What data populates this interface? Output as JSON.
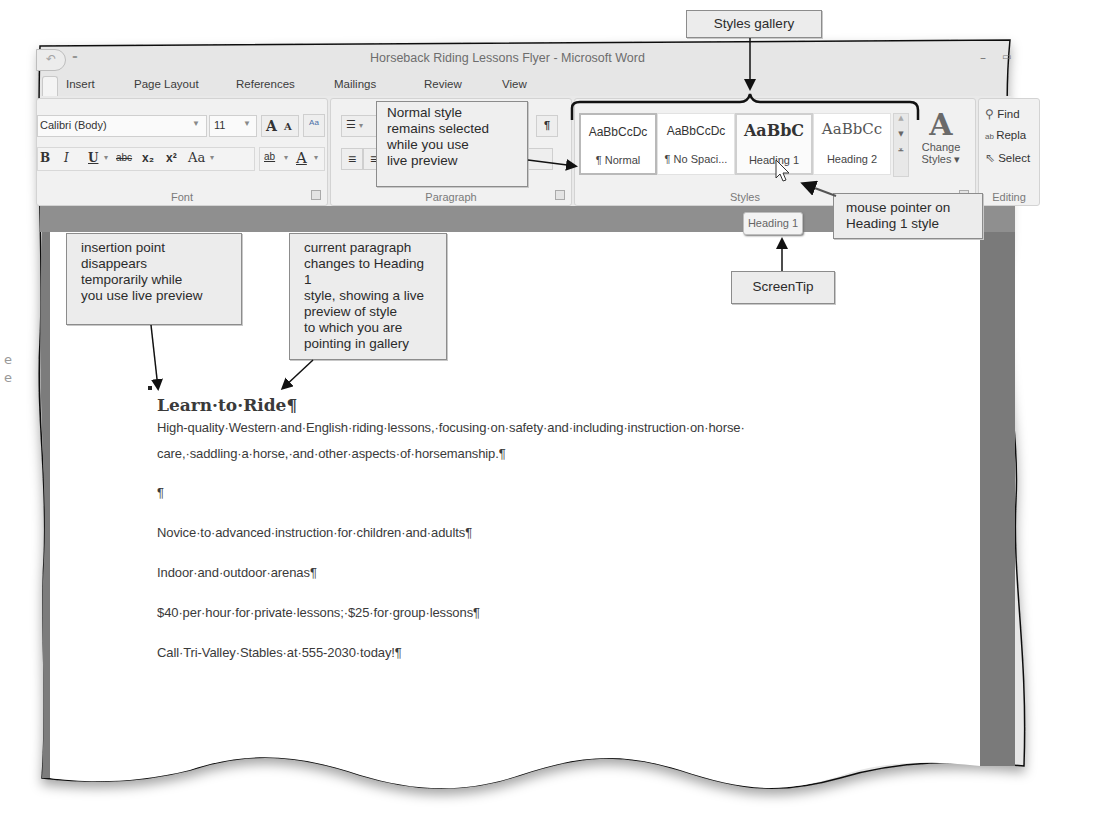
{
  "window": {
    "title": "Horseback Riding Lessons Flyer - Microsoft Word",
    "qat": {
      "undo_icon": "↶",
      "customize_icon": "⁼"
    },
    "controls": {
      "minimize": "–",
      "restore": "▭"
    }
  },
  "tabs": [
    {
      "label": "Insert"
    },
    {
      "label": "Page Layout"
    },
    {
      "label": "References"
    },
    {
      "label": "Mailings"
    },
    {
      "label": "Review"
    },
    {
      "label": "View"
    }
  ],
  "ribbon": {
    "font": {
      "label": "Font",
      "font_name": "Calibri (Body)",
      "font_size": "11",
      "grow_icon": "A",
      "shrink_icon": "A",
      "clear_format_icon": "Aa",
      "bold": "B",
      "italic": "I",
      "underline": "U",
      "strikethrough": "abc",
      "subscript": "x₂",
      "superscript": "x²",
      "change_case": "Aa",
      "highlight": "ab",
      "font_color": "A"
    },
    "paragraph": {
      "label": "Paragraph",
      "bullets_icon": "☰",
      "show_hide": "¶",
      "align_left_icon": "≡",
      "center_icon": "≡"
    },
    "styles": {
      "label": "Styles",
      "tiles": [
        {
          "sample": "AaBbCcDc",
          "name": "¶ Normal",
          "state": "selected"
        },
        {
          "sample": "AaBbCcDc",
          "name": "¶ No Spaci...",
          "state": "normal"
        },
        {
          "sample": "AaBbC",
          "name": "Heading 1",
          "state": "hover"
        },
        {
          "sample": "AaBbCc",
          "name": "Heading 2",
          "state": "normal"
        }
      ],
      "scroll_up": "▲",
      "scroll_down": "▼",
      "more": "⩡",
      "change_styles_icon": "A",
      "change_styles_label_1": "Change",
      "change_styles_label_2": "Styles ▾"
    },
    "editing": {
      "label": "Editing",
      "find": "Find",
      "replace": "Repla",
      "select": "Select"
    }
  },
  "screentip": {
    "text": "Heading 1"
  },
  "document": {
    "heading": "Learn·to·Ride¶",
    "lines": [
      "High-quality·Western·and·English·riding·lessons,·focusing·on·safety·and·including·instruction·on·horse·",
      "care,·saddling·a·horse,·and·other·aspects·of·horsemanship.¶",
      "¶",
      "Novice·to·advanced·instruction·for·children·and·adults¶",
      "Indoor·and·outdoor·arenas¶",
      "$40·per·hour·for·private·lessons;·$25·for·group·lessons¶",
      "Call·Tri-Valley·Stables·at·555-2030·today!¶"
    ]
  },
  "callouts": {
    "styles_gallery": "Styles gallery",
    "normal_style": [
      "Normal style",
      "remains selected",
      "while you use",
      "live preview"
    ],
    "mouse_pointer": [
      "mouse pointer on",
      "Heading 1 style"
    ],
    "screentip": "ScreenTip",
    "insertion_point": [
      "insertion point",
      "disappears",
      "temporarily while",
      "you use live preview"
    ],
    "current_paragraph": [
      "current paragraph",
      "changes to Heading 1",
      "style, showing a live",
      "preview of style",
      "to which you are",
      "pointing in gallery"
    ]
  },
  "colors": {
    "ribbon_bg": "#e9e9e9",
    "callout_bg": "#ececec",
    "page_bg": "#ffffff",
    "frame_dark": "#7a7a7a"
  }
}
